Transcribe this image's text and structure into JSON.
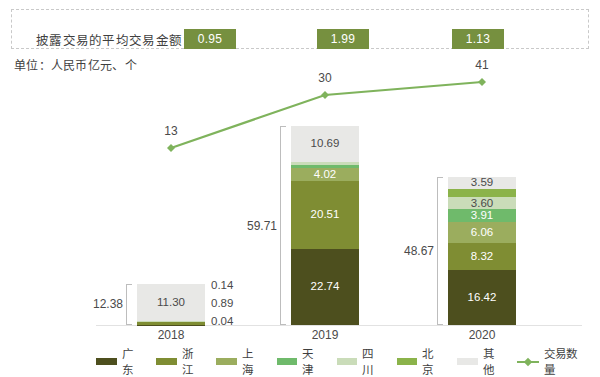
{
  "header": {
    "avg_label": "披露交易的平均交易金额：",
    "avg_values": [
      "0.95",
      "1.99",
      "1.13"
    ],
    "box_color": "#76903f"
  },
  "unit_note": "单位：人民币亿元、个",
  "chart_data": {
    "type": "bar",
    "subtype": "stacked-bar-with-line",
    "title": "",
    "subtitle": "单位：人民币亿元、个",
    "xlabel": "",
    "ylabel": "",
    "categories": [
      "2018",
      "2019",
      "2020"
    ],
    "grid": false,
    "legend_position": "bottom",
    "series": [
      {
        "name": "广东",
        "color": "#4d4f1e",
        "values": [
          0.04,
          22.74,
          16.42
        ]
      },
      {
        "name": "浙江",
        "color": "#7f8d33",
        "values": [
          0.89,
          20.51,
          8.32
        ]
      },
      {
        "name": "上海",
        "color": "#9bad5e",
        "values": [
          0.0,
          4.02,
          6.06
        ]
      },
      {
        "name": "天津",
        "color": "#6fba6b",
        "values": [
          0.0,
          0.87,
          3.91
        ]
      },
      {
        "name": "四川",
        "color": "#cadcb9",
        "values": [
          0.14,
          0.9,
          3.6
        ]
      },
      {
        "name": "北京",
        "color": "#8bb34a",
        "values": [
          0.0,
          0.0,
          2.48
        ]
      },
      {
        "name": "其他",
        "color": "#e8e8e6",
        "values": [
          11.3,
          10.69,
          3.59
        ]
      }
    ],
    "totals": [
      "12.38",
      "59.71",
      "48.67"
    ],
    "line_series": {
      "name": "交易数量",
      "color": "#7fb35c",
      "values": [
        13,
        30,
        41
      ],
      "labels": [
        "13",
        "30",
        "41"
      ]
    },
    "bar_segment_labels": {
      "2018": [
        "11.30",
        "0.14",
        "0.89",
        "0.04"
      ],
      "2019": [
        "10.69",
        "0.90",
        "0.87",
        "4.02",
        "20.51",
        "22.74"
      ],
      "2020": [
        "3.59",
        "2.48",
        "3.60",
        "3.91",
        "6.06",
        "8.32",
        "16.42"
      ]
    }
  },
  "legend": {
    "items": [
      {
        "label": "广东",
        "color": "#4d4f1e"
      },
      {
        "label": "浙江",
        "color": "#7f8d33"
      },
      {
        "label": "上海",
        "color": "#9bad5e"
      },
      {
        "label": "天津",
        "color": "#6fba6b"
      },
      {
        "label": "四川",
        "color": "#cadcb9"
      },
      {
        "label": "北京",
        "color": "#8bb34a"
      },
      {
        "label": "其他",
        "color": "#e8e8e6"
      }
    ],
    "line_label": "交易数量"
  }
}
